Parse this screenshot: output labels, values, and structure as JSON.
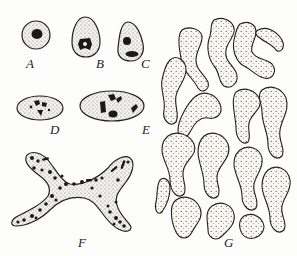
{
  "figure": {
    "type": "scientific-illustration",
    "colors": {
      "ink": "#1a1a1a",
      "stipple": "#555555",
      "paper": "#fdfdfb"
    },
    "panels": [
      {
        "id": "A",
        "label": "A",
        "shape": "round nucleus, single central dark body"
      },
      {
        "id": "B",
        "label": "B",
        "shape": "egg-shaped nucleus, cross-like dark mass"
      },
      {
        "id": "C",
        "label": "C",
        "shape": "pear-shaped nucleus, two dark bodies"
      },
      {
        "id": "D",
        "label": "D",
        "shape": "oval nucleus, clustered irregular dark bodies"
      },
      {
        "id": "E",
        "label": "E",
        "shape": "larger oval nucleus, scattered dark bodies"
      },
      {
        "id": "F",
        "label": "F",
        "shape": "X-shaped branched nucleus, many granules"
      },
      {
        "id": "G",
        "label": "G",
        "shape": "highly branched, network-like nucleus"
      }
    ]
  }
}
